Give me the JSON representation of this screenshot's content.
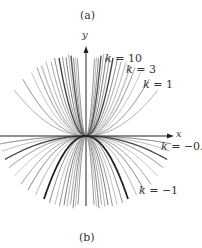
{
  "panel_top_label": "(a)",
  "panel_bottom_label": "(b)",
  "chart_data": {
    "type": "line",
    "title": "",
    "xlabel": "x",
    "ylabel": "y",
    "grid": false,
    "legend": "inline annotations",
    "origin_px": [
      86,
      136
    ],
    "clip_radius_px": 86,
    "scale_px": 28,
    "family": {
      "positive_k": [
        0.25,
        0.4,
        0.6,
        0.8,
        1,
        1.3,
        1.7,
        2.2,
        3,
        4,
        5.5,
        7.5,
        10,
        14,
        20,
        30
      ],
      "negative_k": [
        -0.03,
        -0.06,
        -0.1,
        -0.15,
        -0.22,
        -0.32,
        -0.45,
        -0.65,
        -1,
        -1.4,
        -2,
        -2.8,
        -4,
        -5.5,
        -8,
        -12,
        -18,
        -30
      ]
    },
    "highlighted": [
      {
        "k": 10,
        "label": "k = 10",
        "color": "#555555",
        "width": 1.4
      },
      {
        "k": 3,
        "label": "k = 3",
        "color": "#444444",
        "width": 1.4
      },
      {
        "k": 1,
        "label": "k = 1",
        "color": "#c8c8c8",
        "width": 1.6
      },
      {
        "k": -0.1,
        "label": "k = −0.1",
        "color": "#444444",
        "width": 1.3
      },
      {
        "k": -1,
        "label": "k = −1",
        "color": "#222222",
        "width": 1.8
      }
    ],
    "annotations": [
      {
        "text": "k = 10",
        "x": 105,
        "y": 53
      },
      {
        "text": "k = 3",
        "x": 126,
        "y": 63
      },
      {
        "text": "k = 1",
        "x": 143,
        "y": 78
      },
      {
        "text": "k = −0.1",
        "x": 161,
        "y": 140
      },
      {
        "text": "k = −1",
        "x": 139,
        "y": 184
      }
    ]
  },
  "axes": {
    "x_label": "x",
    "y_label": "y"
  }
}
